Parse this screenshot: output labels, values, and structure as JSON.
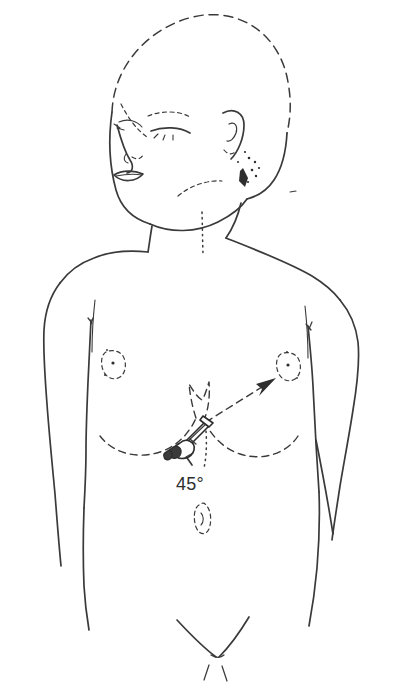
{
  "figure": {
    "kind": "medical-line-drawing",
    "background_color": "#ffffff",
    "ink_color": "#3a3a3a",
    "accent_color": "#2e2e2e"
  },
  "annotations": {
    "angle_label": "45°",
    "angle_value": 45,
    "angle_unit": "degrees"
  },
  "landmarks": {
    "head": "head-outline",
    "hairline": "dashed-hairline",
    "eyebrow": "eyebrow",
    "eye_left": "closed-eye-left",
    "eye_right": "closed-eye-right",
    "nose": "nose",
    "mouth": "lips",
    "ear": "ear",
    "sideburn": "stippled-hair-patch",
    "neck": "neck",
    "sternal_notch": "suprasternal-notch-dots",
    "shoulder_left": "left-shoulder",
    "shoulder_right": "right-shoulder",
    "arm_left": "left-arm",
    "arm_right": "right-arm",
    "nipple_left": "left-nipple",
    "nipple_right": "right-nipple",
    "costal_margin": "dashed-costal-margin",
    "xiphoid": "xiphoid-process",
    "umbilicus": "umbilicus",
    "groin": "inguinal-creases",
    "torso": "torso-outline"
  },
  "instrument": {
    "name": "needle-syringe",
    "hub": "needle-hub",
    "shaft": "needle-shaft",
    "insertion_site": "subxiphoid",
    "insertion_angle": "45°"
  },
  "direction_arrow": {
    "name": "needle-direction-arrow",
    "style": "dashed",
    "points_toward": "left-shoulder"
  },
  "guides": {
    "angle_reference_line": "dotted-vertical-reference",
    "angle_tick_arrow": "angle-indicator-arrow"
  }
}
